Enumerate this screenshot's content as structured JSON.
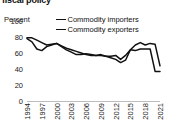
{
  "chart_data": {
    "type": "line",
    "title": "fiscal policy",
    "ylabel": "Percent",
    "xlabel": "",
    "ylim": [
      0,
      100
    ],
    "yticks": [
      0,
      20,
      40,
      60,
      80,
      100
    ],
    "grid": false,
    "legend_position": "top-right",
    "x": [
      1994,
      1995,
      1996,
      1997,
      1998,
      1999,
      2000,
      2001,
      2002,
      2003,
      2004,
      2005,
      2006,
      2007,
      2008,
      2009,
      2010,
      2011,
      2012,
      2013,
      2014,
      2015,
      2016,
      2017,
      2018,
      2019,
      2020,
      2021
    ],
    "xtick_labels": [
      "1994",
      "1997",
      "2000",
      "2003",
      "2006",
      "2009",
      "2012",
      "2015",
      "2018",
      "2021"
    ],
    "xtick_values": [
      1994,
      1997,
      2000,
      2003,
      2006,
      2009,
      2012,
      2015,
      2018,
      2021
    ],
    "series": [
      {
        "name": "Commodity importers",
        "color": "#111111",
        "values": [
          79,
          79,
          76,
          73,
          70,
          71,
          72,
          68,
          64,
          61,
          58,
          58,
          59,
          58,
          57,
          57,
          56,
          56,
          57,
          52,
          57,
          64,
          63,
          65,
          65,
          65,
          37,
          37
        ]
      },
      {
        "name": "Commodity exporters",
        "color": "#111111",
        "values": [
          78,
          74,
          65,
          63,
          68,
          70,
          72,
          69,
          66,
          64,
          62,
          60,
          58,
          57,
          57,
          58,
          56,
          54,
          52,
          48,
          51,
          64,
          70,
          73,
          70,
          72,
          71,
          44
        ]
      }
    ]
  },
  "legend": {
    "items": [
      {
        "label": "Commodity importers"
      },
      {
        "label": "Commodity exporters"
      }
    ]
  },
  "axes": {
    "y_label": "Percent",
    "y_ticks": [
      "100",
      "80",
      "60",
      "40",
      "20",
      "0"
    ]
  }
}
